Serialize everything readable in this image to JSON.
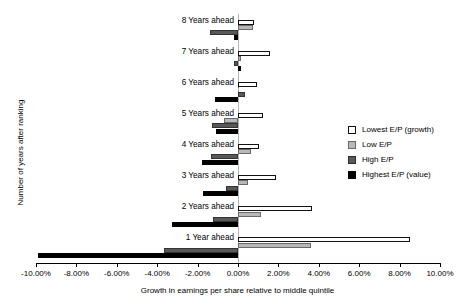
{
  "chart_data": {
    "type": "bar",
    "orientation": "horizontal",
    "title": "",
    "xlabel": "Growth in earnings per share relative to middle quintile",
    "ylabel": "Number of years after ranking",
    "xlim": [
      -10,
      10
    ],
    "xtick_labels": [
      "-10.00%",
      "-8.00%",
      "-6.00%",
      "-4.00%",
      "-2.00%",
      "0.00%",
      "2.00%",
      "4.00%",
      "6.00%",
      "8.00%",
      "10.00%"
    ],
    "xtick_values": [
      -10,
      -8,
      -6,
      -4,
      -2,
      0,
      2,
      4,
      6,
      8,
      10
    ],
    "grid": false,
    "legend_position": "right",
    "categories": [
      "1 Year ahead",
      "2 Years ahead",
      "3 Years ahead",
      "4 Years ahead",
      "5 Years ahead",
      "6 Years ahead",
      "7 Years ahead",
      "8 Years ahead"
    ],
    "series": [
      {
        "name": "Lowest E/P (growth)",
        "color": "#ffffff",
        "values": [
          8.5,
          3.65,
          1.9,
          1.05,
          1.25,
          0.95,
          1.6,
          0.8
        ]
      },
      {
        "name": "Low E/P",
        "color": "#b8b8b8",
        "values": [
          3.6,
          1.15,
          0.5,
          0.65,
          -0.7,
          0.0,
          0.15,
          0.75
        ]
      },
      {
        "name": "High E/P",
        "color": "#585858",
        "values": [
          -3.65,
          -1.25,
          -0.6,
          -1.35,
          -1.3,
          0.35,
          -0.2,
          -1.4
        ]
      },
      {
        "name": "Highest E/P (value)",
        "color": "#000000",
        "values": [
          -9.9,
          -3.25,
          -1.75,
          -1.8,
          -1.1,
          -1.15,
          0.15,
          -0.2
        ]
      }
    ]
  },
  "legend": {
    "items": [
      {
        "label": "Lowest E/P (growth)"
      },
      {
        "label": "Low E/P"
      },
      {
        "label": "High E/P"
      },
      {
        "label": "Highest E/P (value)"
      }
    ]
  }
}
